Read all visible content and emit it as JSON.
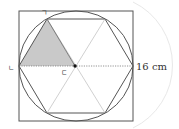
{
  "diagram": {
    "labels": {
      "vertex_top": "ㄱ",
      "vertex_left": "ㄴ",
      "center": "ㄷ",
      "measurement": "16 cm"
    },
    "colors": {
      "stroke": "#555555",
      "shade": "#c8c8c8",
      "dotted": "#777777",
      "arc": "#e6e6e6"
    }
  }
}
